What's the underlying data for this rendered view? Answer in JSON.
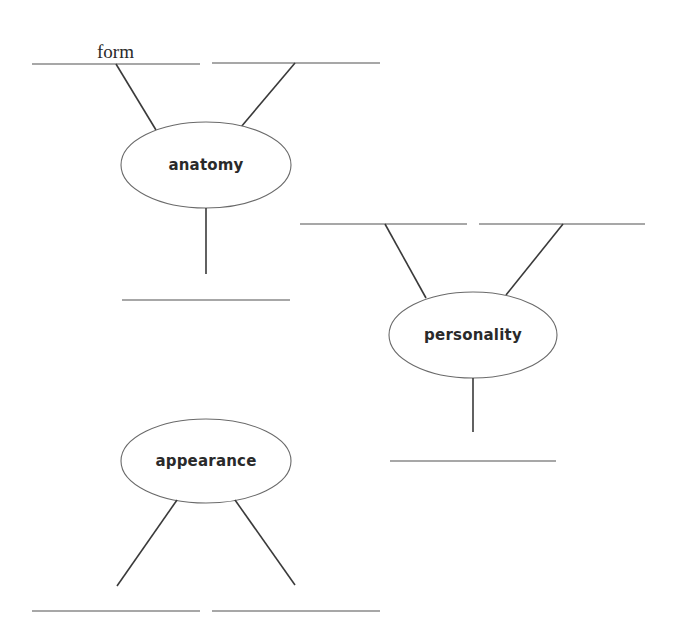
{
  "diagram": {
    "type": "concept-web-worksheet",
    "colors": {
      "background": "#ffffff",
      "answer_line": "#8a8a8a",
      "connector": "#3a3a3a",
      "ellipse_stroke": "#6a6a6a",
      "text": "#2a2a2a"
    },
    "nodes": [
      {
        "id": "anatomy",
        "label": "anatomy",
        "answers": [
          {
            "position": "top-left",
            "text": "form"
          },
          {
            "position": "top-right",
            "text": ""
          },
          {
            "position": "bottom",
            "text": ""
          }
        ]
      },
      {
        "id": "personality",
        "label": "personality",
        "answers": [
          {
            "position": "top-left",
            "text": ""
          },
          {
            "position": "top-right",
            "text": ""
          },
          {
            "position": "bottom",
            "text": ""
          }
        ]
      },
      {
        "id": "appearance",
        "label": "appearance",
        "answers": [
          {
            "position": "bottom-left",
            "text": ""
          },
          {
            "position": "bottom-right",
            "text": ""
          }
        ]
      }
    ]
  }
}
